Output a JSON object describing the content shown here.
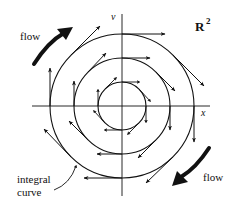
{
  "diagram": {
    "space_label": {
      "base": "R",
      "superscript": "2"
    },
    "axes": {
      "x_label": "x",
      "v_label": "v",
      "center": [
        122,
        106
      ],
      "x_range_px": [
        32,
        210
      ],
      "v_range_px": [
        14,
        196
      ]
    },
    "circles": [
      {
        "name": "inner",
        "radius": 24
      },
      {
        "name": "middle",
        "radius": 48
      },
      {
        "name": "outer",
        "radius": 72
      }
    ],
    "rotation_direction": "clockwise",
    "annotations": {
      "flow_top": "flow",
      "flow_bottom": "flow",
      "integral_curve_line1": "integral",
      "integral_curve_line2": "curve"
    },
    "colors": {
      "ink": "#111111",
      "background": "#ffffff"
    }
  }
}
